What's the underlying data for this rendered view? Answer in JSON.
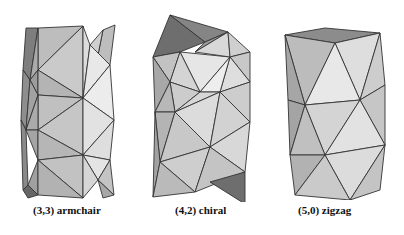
{
  "figure": {
    "panels": [
      {
        "id": "armchair",
        "label": "(3,3) armchair",
        "chirality": [
          3,
          3
        ],
        "type": "armchair"
      },
      {
        "id": "chiral",
        "label": "(4,2) chiral",
        "chirality": [
          4,
          2
        ],
        "type": "chiral"
      },
      {
        "id": "zigzag",
        "label": "(5,0) zigzag",
        "chirality": [
          5,
          0
        ],
        "type": "zigzag"
      }
    ],
    "colors": {
      "background": "#ffffff",
      "edge": "#333333",
      "face_light": "#e6e6e6",
      "face_mid": "#c8c8c8",
      "face_dark": "#8a8a8a",
      "caption": "#111111"
    }
  }
}
